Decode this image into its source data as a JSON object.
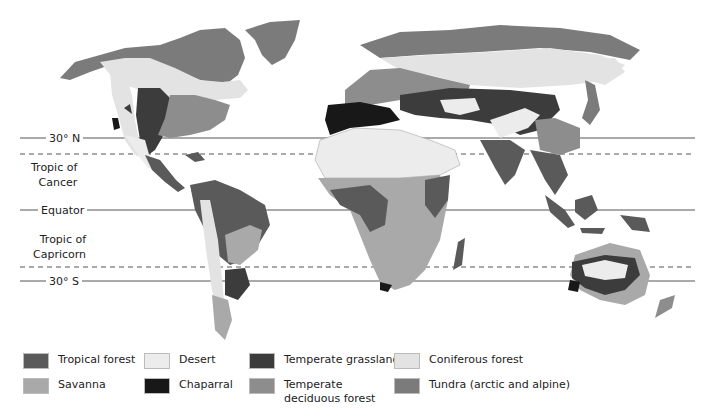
{
  "map": {
    "type": "world-biome-map",
    "latitude_lines": [
      {
        "id": "n30",
        "label": "30° N",
        "y": 138,
        "style": "solid"
      },
      {
        "id": "cancer",
        "label": "Tropic of Cancer",
        "label_line1": "Tropic of",
        "label_line2": "Cancer",
        "y": 154,
        "style": "dashed"
      },
      {
        "id": "equator",
        "label": "Equator",
        "y": 210,
        "style": "solid"
      },
      {
        "id": "capricorn",
        "label": "Tropic of Capricorn",
        "label_line1": "Tropic of",
        "label_line2": "Capricorn",
        "y": 267,
        "style": "dashed"
      },
      {
        "id": "s30",
        "label": "30° S",
        "y": 281,
        "style": "solid"
      }
    ]
  },
  "colors": {
    "tropical_forest": "#5a5a5a",
    "desert": "#ececec",
    "temperate_grassland": "#3c3c3c",
    "coniferous_forest": "#e3e3e3",
    "savanna": "#a9a9a9",
    "chaparral": "#181818",
    "temperate_deciduous": "#8d8d8d",
    "tundra": "#7b7b7b"
  },
  "legend": {
    "items": [
      {
        "key": "tropical_forest",
        "label": "Tropical forest",
        "color": "#5a5a5a"
      },
      {
        "key": "desert",
        "label": "Desert",
        "color": "#ececec"
      },
      {
        "key": "temperate_grassland",
        "label": "Temperate grassland",
        "color": "#3c3c3c"
      },
      {
        "key": "coniferous_forest",
        "label": "Coniferous forest",
        "color": "#e3e3e3"
      },
      {
        "key": "savanna",
        "label": "Savanna",
        "color": "#a9a9a9"
      },
      {
        "key": "chaparral",
        "label": "Chaparral",
        "color": "#181818"
      },
      {
        "key": "temperate_deciduous",
        "label": "Temperate deciduous forest",
        "color": "#8d8d8d"
      },
      {
        "key": "tundra",
        "label": "Tundra (arctic and alpine)",
        "color": "#7b7b7b"
      }
    ]
  }
}
